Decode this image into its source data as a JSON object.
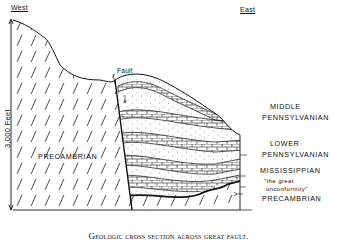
{
  "figure": {
    "orientation": {
      "west": "West",
      "east": "East"
    },
    "fault_label": "Fault",
    "scale_label": "3,000 Feet",
    "units": {
      "precambrian_west": "PRECAMBRIAN",
      "middle_pennsylvanian_1": "MIDDLE",
      "middle_pennsylvanian_2": "PENNSYLVANIAN",
      "lower_pennsylvanian_1": "LOWER",
      "lower_pennsylvanian_2": "PENNSYLVANIAN",
      "mississippian": "MISSISSIPPIAN",
      "unconformity_1": "\"the great",
      "unconformity_2": "unconformity\"",
      "precambrian_east": "PRECAMBRIAN"
    },
    "caption": "Geologic cross section across great fault.",
    "colors": {
      "ink": "#111111",
      "paper": "#ffffff"
    }
  }
}
